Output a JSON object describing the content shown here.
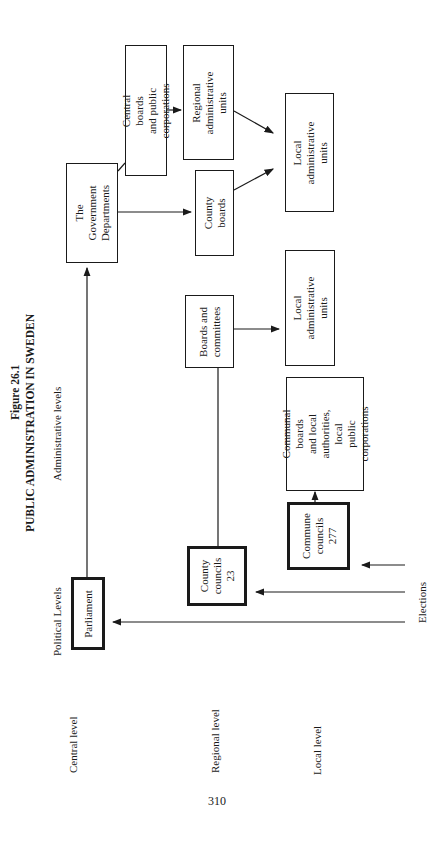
{
  "figure": {
    "number": "Figure 26.1",
    "title": "PUBLIC ADMINISTRATION IN SWEDEN"
  },
  "column_headers": {
    "administrative": "Administrative levels",
    "political": "Political Levels"
  },
  "row_labels": {
    "central": "Central level",
    "regional": "Regional level",
    "local": "Local level"
  },
  "elections_label": "Elections",
  "boxes": {
    "government_departments": "The Government\nDepartments",
    "central_boards": "Central boards\nand public corporations",
    "regional_admin_units": "Regional\nadministrative units",
    "county_boards": "County boards",
    "local_admin_units_central": "Local administrative\nunits",
    "boards_committees": "Boards and\ncommittees",
    "local_admin_units_regional": "Local administrative\nunits",
    "communal_boards": "Communal boards\nand local\nauthorities, local\npublic corporations",
    "parliament": "Parliament",
    "county_councils": "County\ncouncils\n23",
    "commune_councils": "Commune\ncouncils\n277"
  },
  "page_number": "310"
}
